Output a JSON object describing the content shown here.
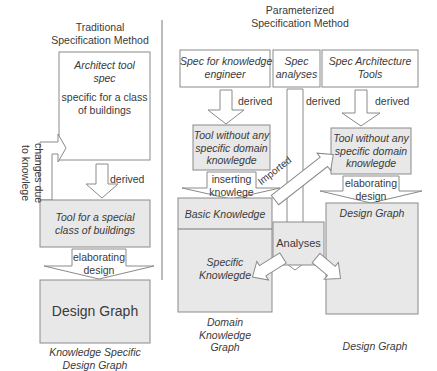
{
  "colors": {
    "box_fill": "#e8e8e8",
    "box_stroke": "#8a8a8a",
    "arrow_fill": "#ffffff",
    "text": "#3a3a3a"
  },
  "traditional": {
    "heading_line1": "Traditional",
    "heading_line2": "Specification Method",
    "architect_box": {
      "title_line1": "Architect tool",
      "title_line2": "spec",
      "body_line1": "specific for a class",
      "body_line2": "of buildings"
    },
    "feedback_arrow": {
      "line1": "changes due",
      "line2": "to knowlege"
    },
    "derived_label": "derived",
    "tool_box": {
      "line1": "Tool for a special",
      "line2": "class of buildings"
    },
    "elaborating_arrow": {
      "line1": "elaborating",
      "line2": "design"
    },
    "design_graph_box": "Design Graph",
    "caption_line1": "Knowledge Specific",
    "caption_line2": "Design Graph"
  },
  "parameterized": {
    "heading_line1": "Parameterized",
    "heading_line2": "Specification Method",
    "spec_knowledge_engineer": {
      "line1": "Spec for knowledge",
      "line2": "engineer"
    },
    "spec_analyses": {
      "line1": "Spec",
      "line2": "analyses"
    },
    "spec_architecture_tools": {
      "line1": "Spec Architecture",
      "line2": "Tools"
    },
    "derived_left": "derived",
    "derived_middle": "derived",
    "derived_right": "derived",
    "tool_left": {
      "line1": "Tool without any",
      "line2": "specific domain",
      "line3": "knowlegde"
    },
    "tool_right": {
      "line1": "Tool without any",
      "line2": "specific domain",
      "line3": "knowlegde"
    },
    "inserting_arrow": {
      "line1": "inserting",
      "line2": "knowlege"
    },
    "imported_arrow": "Imported",
    "elaborating_arrow": {
      "line1": "elaborating",
      "line2": "design"
    },
    "basic_knowledge": "Basic Knowledge",
    "specific_knowledge": {
      "line1": "Specific",
      "line2": "Knowlegde"
    },
    "analyses_box": "Analyses",
    "design_graph_box": "Design Graph",
    "caption_domain": {
      "line1": "Domain",
      "line2": "Knowledge",
      "line3": "Graph"
    },
    "caption_design": "Design Graph"
  }
}
